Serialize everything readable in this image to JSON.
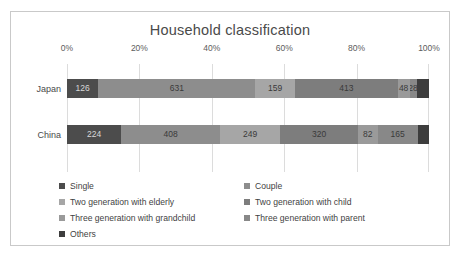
{
  "chart": {
    "title": "Household classification"
  },
  "chart_data": {
    "type": "bar",
    "orientation": "horizontal",
    "stacked": true,
    "normalized": true,
    "title": "Household classification",
    "xlabel": "",
    "ylabel": "",
    "xlim": [
      0,
      100
    ],
    "xtick_labels": [
      "0%",
      "20%",
      "40%",
      "60%",
      "80%",
      "100%"
    ],
    "xtick_values": [
      0,
      20,
      40,
      60,
      80,
      100
    ],
    "grid": true,
    "legend_position": "bottom",
    "categories": [
      "Japan",
      "China"
    ],
    "series": [
      {
        "name": "Single",
        "values": [
          126,
          224
        ],
        "color": "#4c4c4c"
      },
      {
        "name": "Couple",
        "values": [
          631,
          408
        ],
        "color": "#8d8d8d"
      },
      {
        "name": "Two generation with elderly",
        "values": [
          159,
          249
        ],
        "color": "#a6a6a6"
      },
      {
        "name": "Two generation with child",
        "values": [
          413,
          320
        ],
        "color": "#7d7d7d"
      },
      {
        "name": "Three generation with grandchild",
        "values": [
          48,
          82
        ],
        "color": "#9a9a9a"
      },
      {
        "name": "Three generation with parent",
        "values": [
          28,
          165
        ],
        "color": "#888888"
      },
      {
        "name": "Others",
        "values": [
          50,
          47
        ],
        "color": "#3d3d3d"
      }
    ],
    "totals": [
      1455,
      1495
    ]
  },
  "legend": {
    "items": [
      {
        "label": "Single",
        "color": "#4c4c4c"
      },
      {
        "label": "Couple",
        "color": "#8d8d8d"
      },
      {
        "label": "Two generation with elderly",
        "color": "#a6a6a6"
      },
      {
        "label": "Two generation with child",
        "color": "#7d7d7d"
      },
      {
        "label": "Three generation with grandchild",
        "color": "#9a9a9a"
      },
      {
        "label": "Three generation with parent",
        "color": "#888888"
      },
      {
        "label": "Others",
        "color": "#3d3d3d"
      }
    ]
  }
}
